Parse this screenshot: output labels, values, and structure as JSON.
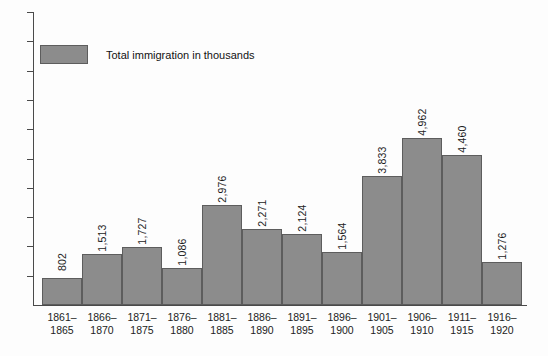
{
  "legend": {
    "label": "Total immigration in thousands",
    "swatch_color": "#8c8c8c",
    "swatch_border": "#5d5d5d"
  },
  "axis": {
    "line_color": "#4a4a4a",
    "y_tick_count": 10,
    "y_labels_shown": false
  },
  "chart_data": {
    "type": "bar",
    "title": "",
    "subtitle": "",
    "xlabel": "",
    "ylabel": "",
    "categories": [
      "1861–1865",
      "1866–1870",
      "1871–1875",
      "1876–1880",
      "1881–1885",
      "1886–1890",
      "1891–1895",
      "1896–1900",
      "1901–1905",
      "1906–1910",
      "1911–1915",
      "1916–1920"
    ],
    "category_lines": [
      [
        "1861–",
        "1865"
      ],
      [
        "1866–",
        "1870"
      ],
      [
        "1871–",
        "1875"
      ],
      [
        "1876–",
        "1880"
      ],
      [
        "1881–",
        "1885"
      ],
      [
        "1886–",
        "1890"
      ],
      [
        "1891–",
        "1895"
      ],
      [
        "1896–",
        "1900"
      ],
      [
        "1901–",
        "1905"
      ],
      [
        "1906–",
        "1910"
      ],
      [
        "1911–",
        "1915"
      ],
      [
        "1916–",
        "1920"
      ]
    ],
    "values": [
      802,
      1513,
      1727,
      1086,
      2976,
      2271,
      2124,
      1564,
      3833,
      4962,
      4460,
      1276
    ],
    "value_labels": [
      "802",
      "1,513",
      "1,727",
      "1,086",
      "2,976",
      "2,271",
      "2,124",
      "1,564",
      "3,833",
      "4,962",
      "4,460",
      "1,276"
    ],
    "series": [
      {
        "name": "Total immigration in thousands",
        "values": [
          802,
          1513,
          1727,
          1086,
          2976,
          2271,
          2124,
          1564,
          3833,
          4962,
          4460,
          1276
        ]
      }
    ],
    "ylim": [
      0,
      5500
    ],
    "grid": false,
    "legend_position": "top-left",
    "bar_color": "#8c8c8c",
    "bar_border_color": "#5d5d5d",
    "data_labels_rotated": true,
    "value_label_rotation_deg": -90
  }
}
